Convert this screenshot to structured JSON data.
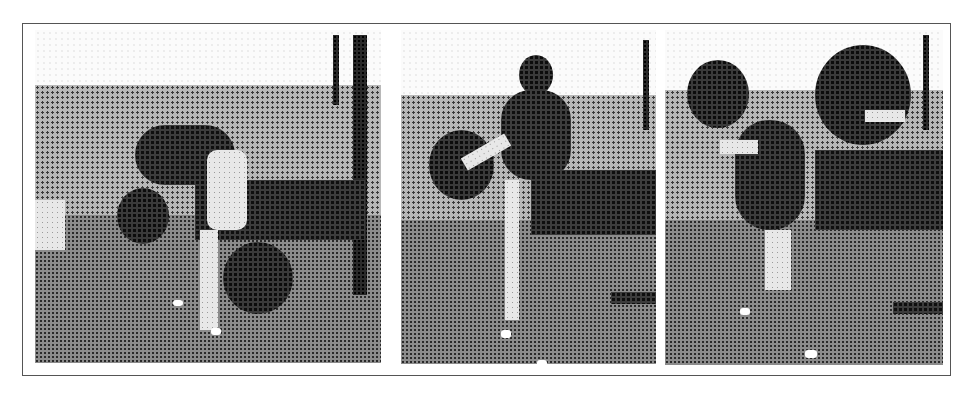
{
  "figure": {
    "style": "halftone",
    "border_color": "#555555",
    "panels": [
      {
        "id": 1,
        "subject": "person bending forward holding medicine ball low, second ball on ground"
      },
      {
        "id": 2,
        "subject": "person standing upright swinging medicine ball at chest height"
      },
      {
        "id": 3,
        "subject": "person holding medicine ball overhead behind head"
      }
    ]
  }
}
